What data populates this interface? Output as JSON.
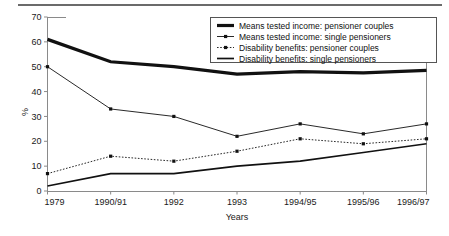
{
  "page": {
    "background_color": "#ffffff",
    "rule_color": "#6b6b6b"
  },
  "chart_data": {
    "type": "line",
    "title": "",
    "xlabel": "Years",
    "ylabel": "%",
    "categories": [
      "1979",
      "1990/91",
      "1992",
      "1993",
      "1994/95",
      "1995/96",
      "1996/97"
    ],
    "ylim": [
      0,
      70
    ],
    "yticks": [
      0,
      10,
      20,
      30,
      40,
      50,
      60,
      70
    ],
    "grid": false,
    "legend_position": "top-right",
    "series": [
      {
        "name": "Means tested income: pensioner couples",
        "style": "thick-solid",
        "markers": false,
        "color": "#111111",
        "values": [
          61,
          52,
          50,
          47,
          48,
          47.5,
          48.5
        ]
      },
      {
        "name": "Means tested income: single pensioners",
        "style": "thin-solid",
        "markers": true,
        "color": "#111111",
        "values": [
          50,
          33,
          30,
          22,
          27,
          23,
          27
        ]
      },
      {
        "name": "Disability benefits: pensioner couples",
        "style": "dotted",
        "markers": true,
        "color": "#111111",
        "values": [
          7,
          14,
          12,
          16,
          21,
          19,
          21
        ]
      },
      {
        "name": "Disability benefits: single pensioners",
        "style": "medium-solid",
        "markers": false,
        "color": "#111111",
        "values": [
          2,
          7,
          7,
          10,
          12,
          15.5,
          19
        ]
      }
    ]
  }
}
